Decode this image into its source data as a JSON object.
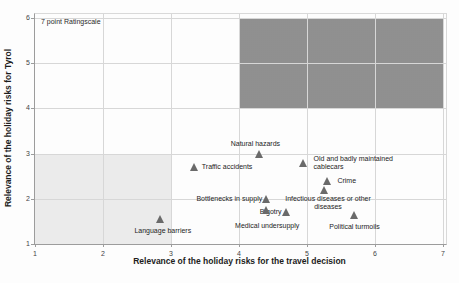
{
  "chart_data": {
    "type": "scatter",
    "annotation": "7 point Ratingscale",
    "xlabel": "Relevance of the holiday risks for the travel decision",
    "ylabel": "Relevance of the holiday risks for Tyrol",
    "xlim": [
      1,
      7
    ],
    "ylim": [
      1,
      6
    ],
    "xticks": [
      "1",
      "2",
      "3",
      "4",
      "5",
      "6",
      "7"
    ],
    "yticks": [
      "1",
      "2",
      "3",
      "4",
      "5",
      "6"
    ],
    "grid": true,
    "legend": "none",
    "marker": "triangle",
    "marker_color": "#6a6a6a",
    "regions": [
      {
        "name": "low-relevance-zone",
        "x0": 1,
        "x1": 3,
        "y0": 1,
        "y1": 3,
        "shade": "light"
      },
      {
        "name": "high-relevance-zone",
        "x0": 4,
        "x1": 7,
        "y0": 4,
        "y1": 6,
        "shade": "dark"
      }
    ],
    "points": [
      {
        "label": "Natural hazards",
        "x": 4.3,
        "y": 3.0,
        "pos": "above",
        "dx": -4,
        "dy": 0
      },
      {
        "label": "Traffic accidents",
        "x": 3.35,
        "y": 2.7,
        "pos": "right",
        "dx": 0,
        "dy": 0
      },
      {
        "label": "Old and badly maintained\ncablecars",
        "x": 4.95,
        "y": 2.8,
        "pos": "right",
        "dx": 3,
        "dy": 0
      },
      {
        "label": "Crime",
        "x": 5.3,
        "y": 2.4,
        "pos": "right",
        "dx": 3,
        "dy": 0
      },
      {
        "label": "Infectious diseases or other\ndiseases",
        "x": 5.25,
        "y": 2.2,
        "pos": "below",
        "dx": 4,
        "dy": -1
      },
      {
        "label": "Bottlenecks in supply",
        "x": 4.4,
        "y": 2.0,
        "pos": "left",
        "dx": 3,
        "dy": 0
      },
      {
        "label": "Bigotry",
        "x": 4.7,
        "y": 1.7,
        "pos": "left",
        "dx": 2,
        "dy": 0
      },
      {
        "label": "Medical undersupply",
        "x": 4.4,
        "y": 1.75,
        "pos": "below",
        "dx": 1,
        "dy": 6
      },
      {
        "label": "Political turmoils",
        "x": 5.7,
        "y": 1.65,
        "pos": "below",
        "dx": 0,
        "dy": 2
      },
      {
        "label": "Language barriers",
        "x": 2.85,
        "y": 1.55,
        "pos": "below",
        "dx": 2,
        "dy": 2
      }
    ]
  }
}
